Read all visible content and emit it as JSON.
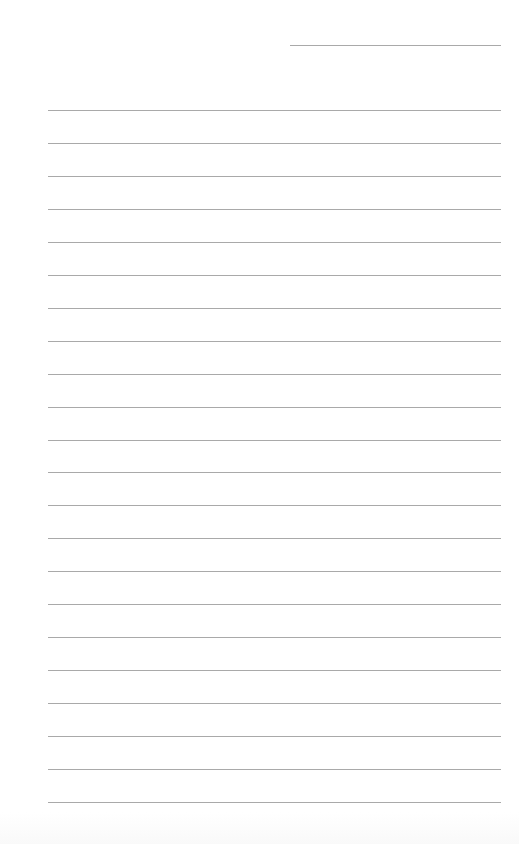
{
  "page": {
    "type": "lined-paper",
    "background_color": "#ffffff",
    "line_color": "#a9a9a9",
    "date_line": {
      "value": ""
    },
    "lines": [
      {
        "text": ""
      },
      {
        "text": ""
      },
      {
        "text": ""
      },
      {
        "text": ""
      },
      {
        "text": ""
      },
      {
        "text": ""
      },
      {
        "text": ""
      },
      {
        "text": ""
      },
      {
        "text": ""
      },
      {
        "text": ""
      },
      {
        "text": ""
      },
      {
        "text": ""
      },
      {
        "text": ""
      },
      {
        "text": ""
      },
      {
        "text": ""
      },
      {
        "text": ""
      },
      {
        "text": ""
      },
      {
        "text": ""
      },
      {
        "text": ""
      },
      {
        "text": ""
      },
      {
        "text": ""
      },
      {
        "text": ""
      }
    ]
  }
}
